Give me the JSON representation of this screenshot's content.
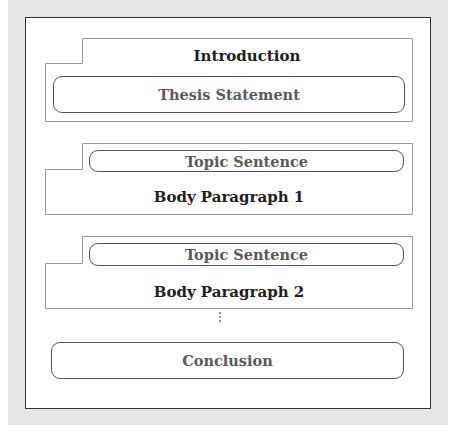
{
  "diagram": {
    "type": "essay-structure",
    "sections": [
      {
        "id": "introduction",
        "heading": "Introduction",
        "inner_box": "Thesis Statement",
        "heading_position": "top"
      },
      {
        "id": "body-paragraph-1",
        "heading": "Body Paragraph 1",
        "inner_box": "Topic Sentence",
        "heading_position": "bottom"
      },
      {
        "id": "body-paragraph-2",
        "heading": "Body Paragraph 2",
        "inner_box": "Topic Sentence",
        "heading_position": "bottom"
      },
      {
        "id": "conclusion",
        "heading": "Conclusion"
      }
    ],
    "continuation_marker": "⋮",
    "colors": {
      "background": "#e6e6e6",
      "outer_border": "#333333",
      "panel_border": "#999999",
      "pill_border": "#555555",
      "heading_text": "#1e1e1e",
      "pill_text": "#5a5a5a"
    }
  }
}
